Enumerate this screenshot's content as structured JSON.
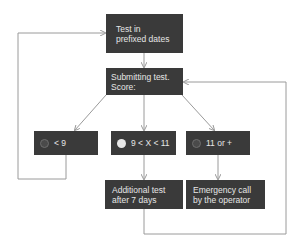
{
  "diagram": {
    "nodes": {
      "start": {
        "label": "Test in\nprefixed dates"
      },
      "submit": {
        "label": "Submitting test.\nScore:"
      },
      "low": {
        "label": "< 9",
        "icon": "circle-outline-icon",
        "icon_color": "#6e6e6e"
      },
      "mid": {
        "label": "9 < X < 11",
        "icon": "circle-filled-icon",
        "icon_color": "#e8e8e8"
      },
      "high": {
        "label": "11 or +",
        "icon": "circle-outline-icon",
        "icon_color": "#6e6e6e"
      },
      "additional": {
        "label": "Additional test\nafter 7 days"
      },
      "emergency": {
        "label": "Emergency call\nby the operator"
      }
    },
    "edges": [
      {
        "from": "start",
        "to": "submit"
      },
      {
        "from": "submit",
        "to": "low"
      },
      {
        "from": "submit",
        "to": "mid"
      },
      {
        "from": "submit",
        "to": "high"
      },
      {
        "from": "mid",
        "to": "additional"
      },
      {
        "from": "high",
        "to": "emergency"
      },
      {
        "from": "low",
        "to": "start"
      },
      {
        "from": "additional",
        "to": "submit"
      }
    ],
    "colors": {
      "box": "#3a3a3a",
      "text": "#e6e6e6",
      "line": "#9a9a9a"
    }
  }
}
